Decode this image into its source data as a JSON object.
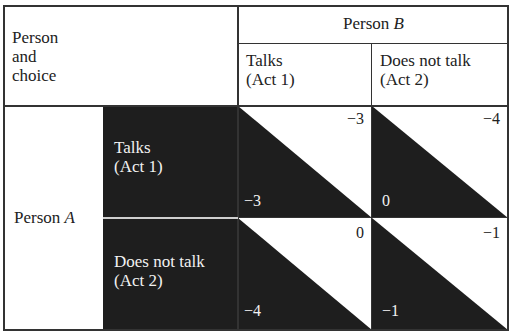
{
  "header": {
    "corner_label_lines": [
      "Person",
      "and",
      "choice"
    ],
    "person_b": {
      "prefix": "Person ",
      "letter": "B"
    },
    "columns": [
      {
        "line1": "Talks",
        "line2": "(Act 1)"
      },
      {
        "line1": "Does not talk",
        "line2": "(Act 2)"
      }
    ]
  },
  "person_a": {
    "prefix": "Person ",
    "letter": "A"
  },
  "rows": [
    {
      "line1": "Talks",
      "line2": "(Act 1)"
    },
    {
      "line1": "Does not talk",
      "line2": "(Act 2)"
    }
  ],
  "payoffs": [
    [
      {
        "b_payoff": "−3",
        "a_payoff": "−3"
      },
      {
        "b_payoff": "−4",
        "a_payoff": "0"
      }
    ],
    [
      {
        "b_payoff": "0",
        "a_payoff": "−4"
      },
      {
        "b_payoff": "−1",
        "a_payoff": "−1"
      }
    ]
  ],
  "colors": {
    "dark_fill": "#1e1e1e",
    "border": "#333333",
    "background": "#ffffff"
  }
}
